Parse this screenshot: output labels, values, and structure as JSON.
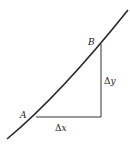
{
  "diagram": {
    "title": "",
    "curve": {
      "description": "increasing convex curve"
    },
    "points": [
      {
        "label": "A"
      },
      {
        "label": "B"
      }
    ],
    "segments": {
      "horizontal_label_delta": "Δ",
      "horizontal_label_var": "x",
      "vertical_label_delta": "Δ",
      "vertical_label_var": "y"
    },
    "colors": {
      "line": "#2a2a2a",
      "background": "#ffffff"
    }
  }
}
